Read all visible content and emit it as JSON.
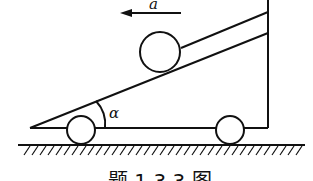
{
  "diagram": {
    "acceleration_label": "a",
    "angle_label": "α",
    "caption": "题 1.3.3 图",
    "colors": {
      "stroke": "#111111",
      "background": "#ffffff"
    }
  }
}
